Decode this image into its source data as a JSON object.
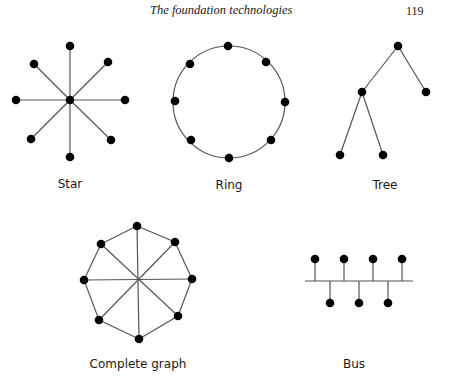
{
  "header": {
    "running_title": "The foundation technologies",
    "page_number": "119"
  },
  "figure": {
    "edge_color": "#555555",
    "node_color": "#000000",
    "diagrams": [
      {
        "id": "star",
        "label": "Star",
        "center": [
          70,
          100
        ],
        "nodes": [
          [
            70,
            46
          ],
          [
            108,
            62
          ],
          [
            125,
            100
          ],
          [
            111,
            140
          ],
          [
            70,
            157
          ],
          [
            31,
            139
          ],
          [
            16,
            100
          ],
          [
            34,
            64
          ]
        ],
        "edges": "spokes"
      },
      {
        "id": "ring",
        "label": "Ring",
        "circle": {
          "cx": 229,
          "cy": 102,
          "r": 56
        },
        "nodes": [
          [
            228,
            46
          ],
          [
            266,
            62
          ],
          [
            285,
            102
          ],
          [
            271,
            140
          ],
          [
            229,
            158
          ],
          [
            191,
            140
          ],
          [
            175,
            101
          ],
          [
            190,
            64
          ]
        ]
      },
      {
        "id": "tree",
        "label": "Tree",
        "nodes": [
          [
            398,
            46
          ],
          [
            362,
            92
          ],
          [
            426,
            92
          ],
          [
            340,
            155
          ],
          [
            383,
            155
          ]
        ],
        "edges": [
          [
            0,
            1
          ],
          [
            0,
            2
          ],
          [
            1,
            3
          ],
          [
            1,
            4
          ]
        ]
      },
      {
        "id": "complete-graph",
        "label": "Complete graph",
        "center": [
          138,
          280
        ],
        "nodes": [
          [
            137,
            226
          ],
          [
            175,
            242
          ],
          [
            192,
            279
          ],
          [
            178,
            316
          ],
          [
            139,
            339
          ],
          [
            99,
            320
          ],
          [
            84,
            280
          ],
          [
            101,
            244
          ]
        ]
      },
      {
        "id": "bus",
        "label": "Bus",
        "backbone": [
          [
            305,
            281
          ],
          [
            413,
            281
          ]
        ],
        "top_nodes": [
          [
            315,
            259
          ],
          [
            344,
            259
          ],
          [
            373,
            259
          ],
          [
            402,
            259
          ]
        ],
        "bottom_nodes": [
          [
            330,
            303
          ],
          [
            359,
            303
          ],
          [
            388,
            303
          ]
        ]
      }
    ]
  }
}
